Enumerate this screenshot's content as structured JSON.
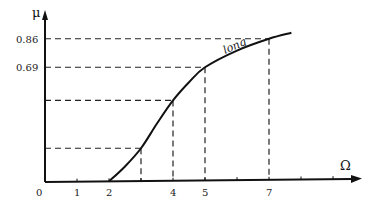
{
  "chart_data": {
    "type": "line",
    "title": "",
    "xlabel": "Ω",
    "ylabel": "μ",
    "x_ticks": [
      0,
      1,
      2,
      4,
      5,
      7
    ],
    "x_tick_labels": [
      "0",
      "1",
      "2",
      "4",
      "5",
      "7"
    ],
    "y_tick_labels": [
      "0.86",
      "0.69"
    ],
    "y_ticks": [
      0.86,
      0.69
    ],
    "xlim": [
      0,
      9.8
    ],
    "ylim": [
      0,
      1.05
    ],
    "grid": false,
    "legend": null,
    "series": [
      {
        "name": "long",
        "x": [
          2,
          2.5,
          3,
          3.5,
          4,
          4.5,
          5,
          6,
          7,
          7.7
        ],
        "y": [
          0,
          0.09,
          0.2,
          0.35,
          0.49,
          0.6,
          0.69,
          0.79,
          0.86,
          0.895
        ]
      }
    ],
    "reference_points": [
      {
        "x": 3,
        "y": 0.2,
        "y_label": ""
      },
      {
        "x": 4,
        "y": 0.49,
        "y_label": ""
      },
      {
        "x": 5,
        "y": 0.69,
        "y_label": "0.69"
      },
      {
        "x": 7,
        "y": 0.86,
        "y_label": "0.86"
      }
    ],
    "annotations": [
      {
        "text": "long",
        "near_x": 5.7,
        "near_y": 0.78,
        "style": "italic"
      }
    ]
  },
  "labels": {
    "y_axis": "μ",
    "x_axis": "Ω",
    "curve": "long",
    "origin": "0"
  }
}
